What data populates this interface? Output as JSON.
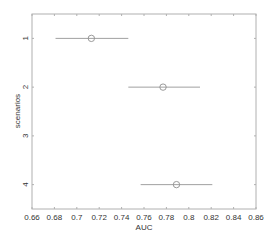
{
  "chart_data": {
    "type": "errorbar",
    "title": "",
    "xlabel": "AUC",
    "ylabel": "scenarios",
    "xlim": [
      0.66,
      0.86
    ],
    "ylim": [
      0.5,
      4.5
    ],
    "y_reversed": true,
    "grid": false,
    "xticks": [
      "0.66",
      "0.68",
      "0.7",
      "0.72",
      "0.74",
      "0.76",
      "0.78",
      "0.8",
      "0.82",
      "0.84",
      "0.86"
    ],
    "yticks": [
      "1",
      "2",
      "3",
      "4"
    ],
    "points": [
      {
        "scenario": 1,
        "auc": 0.713,
        "lower": 0.681,
        "upper": 0.746
      },
      {
        "scenario": 2,
        "auc": 0.777,
        "lower": 0.746,
        "upper": 0.81
      },
      {
        "scenario": 4,
        "auc": 0.789,
        "lower": 0.757,
        "upper": 0.821
      }
    ],
    "colors": {
      "axis": "#b0b0b0",
      "line": "#a0a0a0",
      "marker": "#909090",
      "text": "#333333"
    }
  }
}
